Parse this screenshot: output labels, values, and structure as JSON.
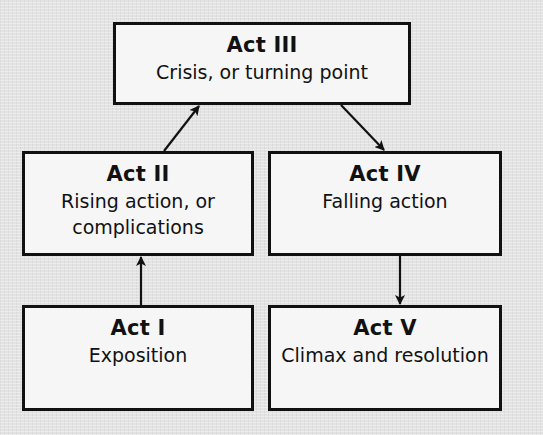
{
  "diagram": {
    "type": "flow",
    "colors": {
      "background": "#e3e3e3",
      "box_fill": "#f6f6f6",
      "border": "#111111",
      "arrow": "#111111"
    },
    "nodes": [
      {
        "id": "act1",
        "title": "Act I",
        "description": "Exposition"
      },
      {
        "id": "act2",
        "title": "Act II",
        "description": "Rising action, or complications"
      },
      {
        "id": "act3",
        "title": "Act III",
        "description": "Crisis, or turning point"
      },
      {
        "id": "act4",
        "title": "Act IV",
        "description": "Falling action"
      },
      {
        "id": "act5",
        "title": "Act V",
        "description": "Climax and resolution"
      }
    ],
    "edges": [
      {
        "from": "act1",
        "to": "act2"
      },
      {
        "from": "act2",
        "to": "act3"
      },
      {
        "from": "act3",
        "to": "act4"
      },
      {
        "from": "act4",
        "to": "act5"
      }
    ]
  }
}
